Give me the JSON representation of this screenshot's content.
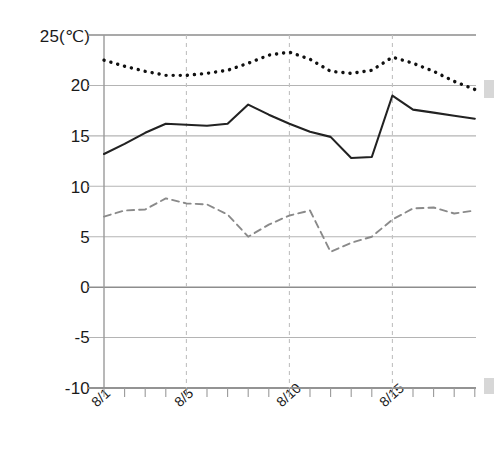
{
  "chart_data": {
    "type": "line",
    "title": "",
    "xlabel": "",
    "ylabel": "",
    "yunit": "℃",
    "ylim": [
      -10,
      25
    ],
    "yticks": [
      25,
      20,
      15,
      10,
      5,
      0,
      -5,
      -10
    ],
    "ytick_labels": [
      "25",
      "20",
      "15",
      "10",
      "5",
      "0",
      "-5",
      "-10"
    ],
    "ytick_top_label": "25(℃)",
    "grid": true,
    "legend": "none",
    "x": [
      "8/1",
      "8/2",
      "8/3",
      "8/4",
      "8/5",
      "8/6",
      "8/7",
      "8/8",
      "8/9",
      "8/10",
      "8/11",
      "8/12",
      "8/13",
      "8/14",
      "8/15",
      "8/16",
      "8/17",
      "8/18",
      "8/19"
    ],
    "xtick_labels": [
      "8/1",
      "8/5",
      "8/10",
      "8/15"
    ],
    "xtick_label_positions": [
      0,
      4,
      9,
      14
    ],
    "xlim": [
      "8/1",
      "8/19"
    ],
    "series": [
      {
        "name": "upper-dotted-series",
        "style": "dotted",
        "color": "#111111",
        "values": [
          22.5,
          21.9,
          21.4,
          21.0,
          21.0,
          21.2,
          21.5,
          22.2,
          23.0,
          23.3,
          22.6,
          21.4,
          21.2,
          21.5,
          22.8,
          22.2,
          21.4,
          20.4,
          19.6
        ]
      },
      {
        "name": "middle-solid-series",
        "style": "solid",
        "color": "#222222",
        "values": [
          13.2,
          14.2,
          15.3,
          16.2,
          16.1,
          16.0,
          16.2,
          18.1,
          17.1,
          16.2,
          15.4,
          14.9,
          12.8,
          12.9,
          19.0,
          17.6,
          17.3,
          17.0,
          16.7
        ]
      },
      {
        "name": "lower-dashed-series",
        "style": "dashed",
        "color": "#8a8a8a",
        "values": [
          7.0,
          7.6,
          7.7,
          8.8,
          8.3,
          8.2,
          7.2,
          5.0,
          6.2,
          7.1,
          7.6,
          3.5,
          4.4,
          5.0,
          6.7,
          7.8,
          7.9,
          7.3,
          7.6
        ]
      }
    ]
  },
  "axes": {
    "y_axis_name": "temperature-axis",
    "x_axis_name": "date-axis"
  }
}
